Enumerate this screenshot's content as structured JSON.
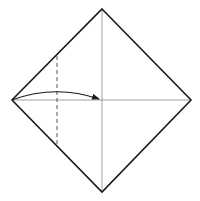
{
  "diagram": {
    "type": "origami-step",
    "colors": {
      "background": "#ffffff",
      "outline": "#1a1a1a",
      "crease": "#888888",
      "dashed": "#555555",
      "arrow": "#1a1a1a"
    },
    "vertices": {
      "top": [
        102,
        9
      ],
      "right": [
        191,
        100
      ],
      "bottom": [
        102,
        192
      ],
      "left": [
        12,
        100
      ]
    },
    "center": [
      102,
      100
    ],
    "fold_line": {
      "x": 57,
      "y1": 56,
      "y2": 145,
      "style": "dashed"
    },
    "arrow": {
      "from": [
        12,
        100
      ],
      "to": [
        99,
        100
      ],
      "control": [
        55,
        84
      ]
    }
  }
}
